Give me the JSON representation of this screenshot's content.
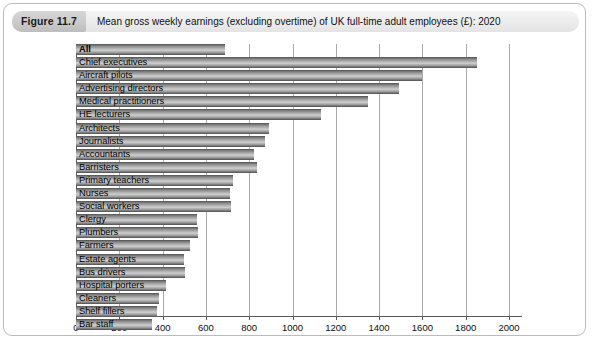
{
  "figure": {
    "number": "Figure 11.7",
    "title": "Mean gross weekly earnings (excluding overtime) of UK full-time adult employees (£): 2020"
  },
  "chart_data": {
    "type": "bar",
    "orientation": "horizontal",
    "title": "Mean gross weekly earnings (excluding overtime) of UK full-time adult employees (£): 2020",
    "xlabel": "",
    "ylabel": "",
    "xlim": [
      0,
      2000
    ],
    "xticks": [
      0,
      200,
      400,
      600,
      800,
      1000,
      1200,
      1400,
      1600,
      1800,
      2000
    ],
    "tick_labels": [
      "0",
      "200",
      "400",
      "600",
      "800",
      "1000",
      "1200",
      "1400",
      "1600",
      "1800",
      "2000"
    ],
    "grid": true,
    "legend": "none",
    "categories": [
      "All",
      "Chief executives",
      "Aircraft pilots",
      "Advertising directors",
      "Medical practitioners",
      "HE lecturers",
      "Architects",
      "Journalists",
      "Accountants",
      "Barristers",
      "Primary teachers",
      "Nurses",
      "Social workers",
      "Clergy",
      "Plumbers",
      "Farmers",
      "Estate agents",
      "Bus drivers",
      "Hospital porters",
      "Cleaners",
      "Shelf fillers",
      "Bar staff"
    ],
    "values": [
      690,
      1850,
      1600,
      1490,
      1350,
      1130,
      890,
      875,
      820,
      835,
      725,
      710,
      715,
      560,
      565,
      525,
      500,
      505,
      415,
      385,
      375,
      350
    ],
    "bold_categories": [
      "All"
    ]
  },
  "colors": {
    "frame_border": "#b9bcc0",
    "caption_background": "#ececec",
    "figure_tag_background": "#c9c9c9",
    "bar_light": "#cfcfcf",
    "bar_dark": "#6e6e6e",
    "axis": "#5a5a5a",
    "gridline": "#a9a9a9",
    "text": "#101010"
  }
}
